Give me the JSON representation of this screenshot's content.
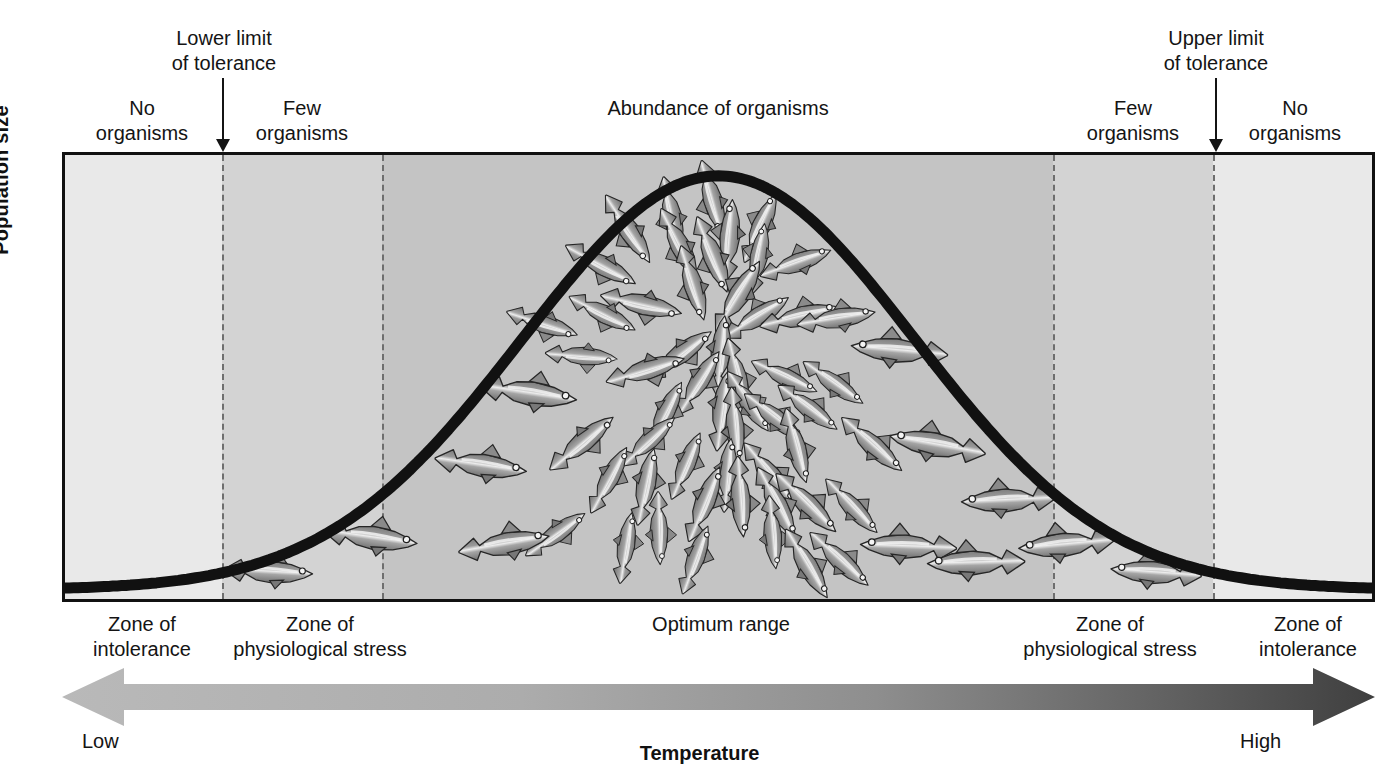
{
  "figure": {
    "axis": {
      "y_label": "Population size",
      "x_label": "Temperature",
      "x_low": "Low",
      "x_high": "High"
    },
    "top_annotations": {
      "lower_limit": "Lower limit\nof tolerance",
      "upper_limit": "Upper limit\nof tolerance",
      "lower_limit_line1": "Lower limit",
      "lower_limit_line2": "of tolerance",
      "upper_limit_line1": "Upper limit",
      "upper_limit_line2": "of tolerance",
      "no_organisms_left_l1": "No",
      "no_organisms_left_l2": "organisms",
      "few_organisms_left_l1": "Few",
      "few_organisms_left_l2": "organisms",
      "abundance": "Abundance of organisms",
      "few_organisms_right_l1": "Few",
      "few_organisms_right_l2": "organisms",
      "no_organisms_right_l1": "No",
      "no_organisms_right_l2": "organisms"
    },
    "zone_labels": {
      "intolerance_left_l1": "Zone of",
      "intolerance_left_l2": "intolerance",
      "stress_left_l1": "Zone of",
      "stress_left_l2": "physiological stress",
      "optimum": "Optimum range",
      "stress_right_l1": "Zone of",
      "stress_right_l2": "physiological stress",
      "intolerance_right_l1": "Zone of",
      "intolerance_right_l2": "intolerance"
    },
    "colors": {
      "zone_intolerance_fill": "#e9e9e9",
      "zone_stress_fill": "#d3d3d3",
      "zone_optimum_fill": "#c4c4c4",
      "curve": "#111111",
      "frame": "#111111",
      "divider": "#6e6e6e",
      "arrow_low": "#b4b4b4",
      "arrow_high": "#4a4a4a",
      "fish_body": "#8e8e8e",
      "fish_belly": "#e8e8e8",
      "fish_outline": "#2a2a2a"
    }
  },
  "chart_data": {
    "type": "line",
    "xlabel": "Temperature",
    "ylabel": "Population size",
    "xlim": [
      0,
      100
    ],
    "ylim": [
      0,
      100
    ],
    "grid": false,
    "legend": "none",
    "curve_name": "Population size vs temperature (normal / bell curve)",
    "x": [
      0,
      5,
      10,
      15,
      20,
      25,
      30,
      35,
      40,
      45,
      50,
      55,
      60,
      65,
      70,
      75,
      80,
      85,
      90,
      95,
      100
    ],
    "y": [
      1,
      2,
      3,
      5,
      9,
      17,
      30,
      48,
      68,
      86,
      96,
      99,
      93,
      79,
      60,
      40,
      23,
      12,
      6,
      3,
      1
    ],
    "peak_x": 50,
    "peak_y": 99,
    "zones": [
      {
        "name": "Zone of intolerance",
        "side": "left",
        "x_start": 0,
        "x_end": 12.2,
        "fill": "#e9e9e9",
        "top_label": "No organisms"
      },
      {
        "name": "Zone of physiological stress",
        "side": "left",
        "x_start": 12.2,
        "x_end": 24.4,
        "fill": "#d3d3d3",
        "top_label": "Few organisms"
      },
      {
        "name": "Optimum range",
        "side": "center",
        "x_start": 24.4,
        "x_end": 75.5,
        "fill": "#c4c4c4",
        "top_label": "Abundance of organisms"
      },
      {
        "name": "Zone of physiological stress",
        "side": "right",
        "x_start": 75.5,
        "x_end": 87.9,
        "fill": "#d3d3d3",
        "top_label": "Few organisms"
      },
      {
        "name": "Zone of intolerance",
        "side": "right",
        "x_start": 87.9,
        "x_end": 100,
        "fill": "#e9e9e9",
        "top_label": "No organisms"
      }
    ],
    "markers": [
      {
        "label": "Lower limit of tolerance",
        "x": 12.2,
        "type": "down-arrow"
      },
      {
        "label": "Upper limit of tolerance",
        "x": 87.9,
        "type": "down-arrow"
      }
    ],
    "annotations": [
      "No organisms",
      "Few organisms",
      "Abundance of organisms",
      "Few organisms",
      "No organisms",
      "Zone of intolerance",
      "Zone of physiological stress",
      "Optimum range",
      "Zone of physiological stress",
      "Zone of intolerance",
      "Low",
      "High"
    ],
    "x_axis_gradient_arrow": {
      "direction": "double",
      "low_end": "Low",
      "high_end": "High"
    },
    "organism_density_illustration": "school of fish, density proportional to curve height (sparse in stress zones, dense at optimum)"
  }
}
